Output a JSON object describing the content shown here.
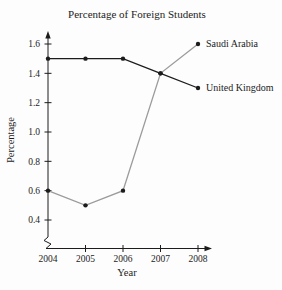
{
  "chart_data": {
    "type": "line",
    "title": "Percentage of Foreign Students",
    "xlabel": "Year",
    "ylabel": "Percentage",
    "categories": [
      "2004",
      "2005",
      "2006",
      "2007",
      "2008"
    ],
    "series": [
      {
        "name": "Saudi Arabia",
        "values": [
          0.6,
          0.5,
          0.6,
          1.4,
          1.6
        ],
        "line_color": "#9b9b9b"
      },
      {
        "name": "United Kingdom",
        "values": [
          1.5,
          1.5,
          1.5,
          1.4,
          1.3
        ],
        "line_color": "#1c1c1c"
      }
    ],
    "yticks": [
      "0.4",
      "0.6",
      "0.8",
      "1.0",
      "1.2",
      "1.4",
      "1.6"
    ],
    "ylim": [
      0.4,
      1.6
    ],
    "xlim_years": [
      2004,
      2008
    ],
    "grid": false,
    "axis_break_bottom": true,
    "axis_arrows": true,
    "legend_position": "line-end-labels",
    "marker": "filled-circle",
    "marker_color": "#1c1c1c",
    "axis_color": "#1c1c1c",
    "background_color": "#fdfdfd"
  }
}
